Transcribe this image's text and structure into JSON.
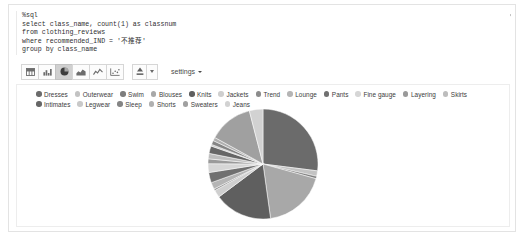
{
  "status": {
    "menu_icon": "hamburger-icon",
    "job_label": "SPARK JOB",
    "state_label": "FINISHED",
    "icons": [
      "play-icon",
      "grid-icon",
      "book-icon",
      "gear-icon"
    ]
  },
  "editor": {
    "lines": [
      "%sql",
      "select class_name, count(1) as classnum",
      "from clothing_reviews",
      "where recommended_IND = '不推荐'",
      "group by class_name"
    ]
  },
  "toolbar": {
    "chart_buttons": [
      {
        "name": "table-view-button",
        "icon": "table-icon",
        "active": false
      },
      {
        "name": "bar-chart-button",
        "icon": "bar-chart-icon",
        "active": false
      },
      {
        "name": "pie-chart-button",
        "icon": "pie-chart-icon",
        "active": true
      },
      {
        "name": "area-chart-button",
        "icon": "area-chart-icon",
        "active": false
      },
      {
        "name": "line-chart-button",
        "icon": "line-chart-icon",
        "active": false
      },
      {
        "name": "scatter-chart-button",
        "icon": "scatter-chart-icon",
        "active": false
      }
    ],
    "download_icon": "download-icon",
    "download_caret_icon": "chevron-down-icon",
    "settings_label": "settings",
    "settings_caret_icon": "chevron-down-icon"
  },
  "chart_data": {
    "type": "pie",
    "title": "",
    "legend_position": "top",
    "grid": false,
    "categories": [
      "Dresses",
      "Outerwear",
      "Swim",
      "Blouses",
      "Knits",
      "Jackets",
      "Trend",
      "Lounge",
      "Pants",
      "Fine gauge",
      "Layering",
      "Skirts",
      "Intimates",
      "Legwear",
      "Sleep",
      "Shorts",
      "Sweaters",
      "Jeans"
    ],
    "values": [
      27.0,
      1.6,
      0.7,
      18.5,
      17.0,
      2.2,
      0.5,
      2.0,
      3.0,
      2.6,
      1.4,
      1.6,
      2.2,
      0.5,
      1.2,
      1.0,
      13.0,
      4.0
    ],
    "value_unit": "percent",
    "colors": [
      "#6b6b6b",
      "#c3c3c3",
      "#7d7d7d",
      "#a8a8a8",
      "#5f5f5f",
      "#cfcfcf",
      "#8c8c8c",
      "#b5b5b5",
      "#707070",
      "#d6d6d6",
      "#9a9a9a",
      "#bdbdbd",
      "#666666",
      "#c9c9c9",
      "#858585",
      "#b0b0b0",
      "#a0a0a0",
      "#d2d2d2"
    ]
  }
}
